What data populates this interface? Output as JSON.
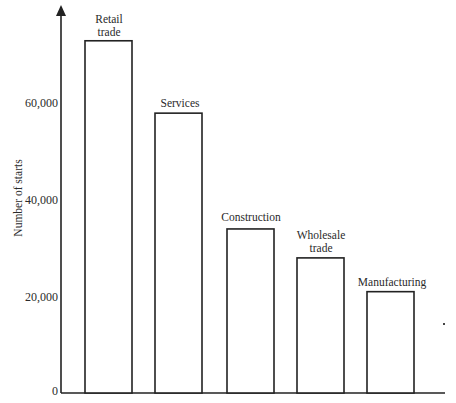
{
  "chart_data": {
    "type": "bar",
    "title": "",
    "xlabel": "",
    "ylabel": "Number of starts",
    "categories": [
      "Retail trade",
      "Services",
      "Construction",
      "Wholesale trade",
      "Manufacturing"
    ],
    "values": [
      73000,
      58000,
      34000,
      28000,
      21000
    ],
    "yticks": [
      0,
      20000,
      40000,
      60000
    ],
    "ytick_labels": [
      "0",
      "20,000",
      "40,000",
      "60,000"
    ],
    "ylim": [
      0,
      78000
    ],
    "grid": false,
    "legend": null,
    "bar_fill": "#ffffff",
    "bar_stroke": "#222222"
  },
  "labels": {
    "ylabel": "Number of starts",
    "ticks": [
      "60,000",
      "40,000",
      "20,000",
      "0"
    ],
    "bars": [
      {
        "line1": "Retail",
        "line2": "trade"
      },
      {
        "line1": "Services",
        "line2": ""
      },
      {
        "line1": "Construction",
        "line2": ""
      },
      {
        "line1": "Wholesale",
        "line2": "trade"
      },
      {
        "line1": "Manufacturing",
        "line2": ""
      }
    ]
  }
}
